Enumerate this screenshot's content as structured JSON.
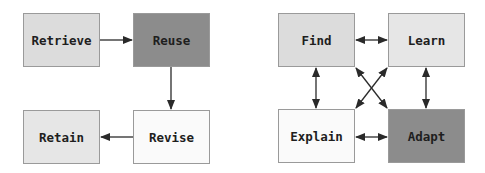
{
  "left_diagram": {
    "nodes": [
      {
        "id": "retrieve",
        "label": "Retrieve",
        "shade": "light"
      },
      {
        "id": "reuse",
        "label": "Reuse",
        "shade": "dark"
      },
      {
        "id": "retain",
        "label": "Retain",
        "shade": "pale"
      },
      {
        "id": "revise",
        "label": "Revise",
        "shade": "white"
      }
    ],
    "edges": [
      {
        "from": "retrieve",
        "to": "reuse",
        "direction": "one-way"
      },
      {
        "from": "reuse",
        "to": "revise",
        "direction": "one-way"
      },
      {
        "from": "revise",
        "to": "retain",
        "direction": "one-way"
      }
    ]
  },
  "right_diagram": {
    "nodes": [
      {
        "id": "find",
        "label": "Find",
        "shade": "light"
      },
      {
        "id": "learn",
        "label": "Learn",
        "shade": "pale"
      },
      {
        "id": "explain",
        "label": "Explain",
        "shade": "white"
      },
      {
        "id": "adapt",
        "label": "Adapt",
        "shade": "dark"
      }
    ],
    "edges": [
      {
        "from": "find",
        "to": "learn",
        "direction": "two-way"
      },
      {
        "from": "find",
        "to": "explain",
        "direction": "two-way"
      },
      {
        "from": "learn",
        "to": "adapt",
        "direction": "two-way"
      },
      {
        "from": "explain",
        "to": "adapt",
        "direction": "two-way"
      },
      {
        "from": "find",
        "to": "adapt",
        "direction": "two-way"
      },
      {
        "from": "learn",
        "to": "explain",
        "direction": "two-way"
      }
    ]
  },
  "colors": {
    "light": "#dcdcdc",
    "dark": "#8c8c8c",
    "pale": "#e6e6e6",
    "white": "#fafafa",
    "arrow": "#2a2a2a"
  }
}
